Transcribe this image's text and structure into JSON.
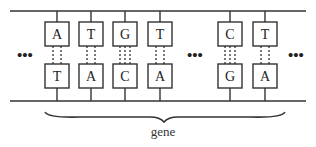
{
  "diagram": {
    "strand_color": "#333333",
    "top_strand": [
      "A",
      "T",
      "G",
      "T",
      "C",
      "T"
    ],
    "bottom_strand": [
      "T",
      "A",
      "C",
      "A",
      "G",
      "A"
    ],
    "hydrogen_bonds": [
      2,
      2,
      3,
      2,
      3,
      2
    ],
    "ellipsis": "•••",
    "brace_label": "gene"
  }
}
